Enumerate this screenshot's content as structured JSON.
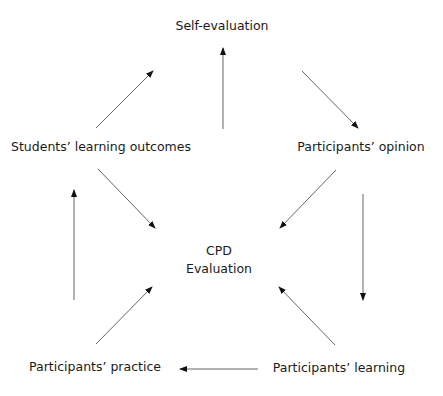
{
  "diagram": {
    "type": "cycle",
    "center": {
      "line1": "CPD",
      "line2": "Evaluation"
    },
    "nodes": [
      {
        "id": "self",
        "label": "Self-evaluation"
      },
      {
        "id": "opinion",
        "label": "Participants’ opinion"
      },
      {
        "id": "learning",
        "label": "Participants’ learning"
      },
      {
        "id": "practice",
        "label": "Participants’ practice"
      },
      {
        "id": "outcomes",
        "label": "Students’ learning outcomes"
      }
    ],
    "edges": [
      {
        "from": "self",
        "to": "opinion"
      },
      {
        "from": "opinion",
        "to": "learning"
      },
      {
        "from": "learning",
        "to": "practice"
      },
      {
        "from": "practice",
        "to": "outcomes"
      },
      {
        "from": "outcomes",
        "to": "self"
      },
      {
        "from": "center",
        "to": "self"
      },
      {
        "from": "opinion",
        "to": "center"
      },
      {
        "from": "learning",
        "to": "center"
      },
      {
        "from": "practice",
        "to": "center"
      },
      {
        "from": "outcomes",
        "to": "center"
      }
    ],
    "colors": {
      "line": "#555555",
      "text": "#1a1a1a"
    }
  }
}
